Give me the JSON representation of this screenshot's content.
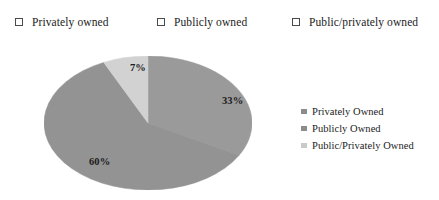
{
  "top_legend": {
    "items": [
      {
        "label": "Privately owned",
        "icon": "empty-checkbox-icon"
      },
      {
        "label": "Publicly owned",
        "icon": "empty-checkbox-icon"
      },
      {
        "label": "Public/privately owned",
        "icon": "empty-checkbox-icon"
      }
    ]
  },
  "side_legend": {
    "items": [
      {
        "label": "Privately Owned",
        "color": "#8c8c8c"
      },
      {
        "label": "Publicly Owned",
        "color": "#8c8c8c"
      },
      {
        "label": "Public/Privately Owned",
        "color": "#c9c9c9"
      }
    ]
  },
  "chart_data": {
    "type": "pie",
    "title": "",
    "subtitle": "",
    "xlabel": "",
    "ylabel": "",
    "legend_position": "right",
    "grid": false,
    "categories": [
      "Privately Owned",
      "Publicly Owned",
      "Public/Privately Owned"
    ],
    "values": [
      33,
      60,
      7
    ],
    "data_labels": [
      "33%",
      "60%",
      "7%"
    ],
    "colors": [
      "#9a9a9a",
      "#939393",
      "#d2d2d2"
    ],
    "start_angle_deg": 0,
    "direction": "clockwise",
    "shape": "ellipse",
    "slices": [
      {
        "name": "Privately Owned",
        "value": 33,
        "label": "33%",
        "color": "#9a9a9a"
      },
      {
        "name": "Publicly Owned",
        "value": 60,
        "label": "60%",
        "color": "#939393"
      },
      {
        "name": "Public/Privately Owned",
        "value": 7,
        "label": "7%",
        "color": "#d2d2d2"
      }
    ]
  },
  "colors": {
    "background": "#ffffff",
    "text": "#1b1b1b",
    "slice_privately_owned": "#9a9a9a",
    "slice_publicly_owned": "#939393",
    "slice_public_privately_owned": "#d2d2d2",
    "checkbox_border": "#4a4a4a"
  }
}
